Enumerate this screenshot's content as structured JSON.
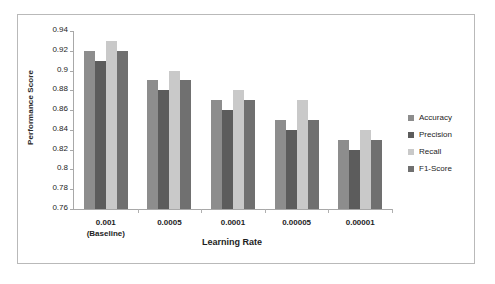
{
  "chart_data": {
    "type": "bar",
    "title": "",
    "xlabel": "Learning Rate",
    "ylabel": "Performance Score",
    "categories": [
      "0.001\n(Baseline)",
      "0.0005",
      "0.0001",
      "0.00005",
      "0.00001"
    ],
    "ylim": [
      0.76,
      0.94
    ],
    "yticks": [
      "0.94",
      "0.92",
      "0.9",
      "0.88",
      "0.86",
      "0.84",
      "0.82",
      "0.8",
      "0.78",
      "0.76"
    ],
    "ytick_values": [
      0.94,
      0.92,
      0.9,
      0.88,
      0.86,
      0.84,
      0.82,
      0.8,
      0.78,
      0.76
    ],
    "grid": false,
    "legend_position": "right",
    "series": [
      {
        "name": "Accuracy",
        "color": "#8d8d8d",
        "values": [
          0.92,
          0.89,
          0.87,
          0.85,
          0.83
        ]
      },
      {
        "name": "Precision",
        "color": "#5c5c5c",
        "values": [
          0.91,
          0.88,
          0.86,
          0.84,
          0.82
        ]
      },
      {
        "name": "Recall",
        "color": "#c9c9c9",
        "values": [
          0.93,
          0.9,
          0.88,
          0.87,
          0.84
        ]
      },
      {
        "name": "F1-Score",
        "color": "#707070",
        "values": [
          0.92,
          0.89,
          0.87,
          0.85,
          0.83
        ]
      }
    ]
  }
}
